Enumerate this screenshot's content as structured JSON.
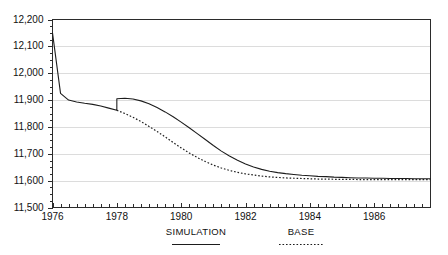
{
  "chart_data": {
    "type": "line",
    "title": "",
    "subtitle": "",
    "xlabel": "",
    "ylabel": "",
    "xlim": [
      1976.0,
      1987.75
    ],
    "ylim": [
      11500,
      12200
    ],
    "grid": true,
    "grid_axis": "y",
    "legend_position": "bottom",
    "y_ticks": [
      11500,
      11600,
      11700,
      11800,
      11900,
      12000,
      12100,
      12200
    ],
    "y_tick_labels": [
      "11,500",
      "11,600",
      "11,700",
      "11,800",
      "11,900",
      "12,000",
      "12,100",
      "12,200"
    ],
    "y_minor_tick_step": 25,
    "x_ticks": [
      1976,
      1978,
      1980,
      1982,
      1984,
      1986
    ],
    "x_tick_labels": [
      "1976",
      "1978",
      "1980",
      "1982",
      "1984",
      "1986"
    ],
    "x_minor_tick_step": 0.25,
    "series": [
      {
        "name": "SIMULATION",
        "style": "solid",
        "color": "#1d1d1d",
        "x": [
          1976.0,
          1976.25,
          1976.5,
          1976.75,
          1977.0,
          1977.25,
          1977.5,
          1977.75,
          1978.0,
          1978.0,
          1978.25,
          1978.5,
          1978.75,
          1979.0,
          1979.25,
          1979.5,
          1979.75,
          1980.0,
          1980.25,
          1980.5,
          1980.75,
          1981.0,
          1981.25,
          1981.5,
          1981.75,
          1982.0,
          1982.25,
          1982.5,
          1982.75,
          1983.0,
          1983.25,
          1983.5,
          1983.75,
          1984.0,
          1984.25,
          1984.5,
          1984.75,
          1985.0,
          1985.25,
          1985.5,
          1985.75,
          1986.0,
          1986.25,
          1986.5,
          1986.75,
          1987.0,
          1987.25,
          1987.5,
          1987.75
        ],
        "y": [
          12150,
          11925,
          11900,
          11893,
          11888,
          11884,
          11878,
          11870,
          11862,
          11905,
          11907,
          11904,
          11897,
          11886,
          11872,
          11856,
          11838,
          11818,
          11797,
          11775,
          11753,
          11731,
          11710,
          11692,
          11676,
          11662,
          11651,
          11642,
          11635,
          11630,
          11626,
          11623,
          11620,
          11618,
          11616,
          11615,
          11613,
          11612,
          11611,
          11610,
          11610,
          11609,
          11609,
          11608,
          11608,
          11608,
          11607,
          11607,
          11607
        ]
      },
      {
        "name": "BASE",
        "style": "dotted",
        "color": "#1d1d1d",
        "x": [
          1978.0,
          1978.25,
          1978.5,
          1978.75,
          1979.0,
          1979.25,
          1979.5,
          1979.75,
          1980.0,
          1980.25,
          1980.5,
          1980.75,
          1981.0,
          1981.25,
          1981.5,
          1981.75,
          1982.0,
          1982.25,
          1982.5,
          1982.75,
          1983.0,
          1983.25,
          1983.5,
          1983.75,
          1984.0,
          1984.25,
          1984.5,
          1984.75,
          1985.0,
          1985.25,
          1985.5,
          1985.75,
          1986.0,
          1986.25,
          1986.5,
          1986.75,
          1987.0,
          1987.25,
          1987.5,
          1987.75
        ],
        "y": [
          11862,
          11850,
          11836,
          11820,
          11802,
          11783,
          11763,
          11742,
          11722,
          11703,
          11686,
          11671,
          11658,
          11647,
          11638,
          11631,
          11625,
          11621,
          11617,
          11614,
          11612,
          11610,
          11609,
          11608,
          11607,
          11606,
          11606,
          11605,
          11605,
          11605,
          11604,
          11604,
          11604,
          11604,
          11604,
          11604,
          11604,
          11604,
          11604,
          11604
        ]
      }
    ]
  },
  "legend": {
    "items": [
      {
        "label": "SIMULATION",
        "style": "solid"
      },
      {
        "label": "BASE",
        "style": "dotted"
      }
    ]
  }
}
